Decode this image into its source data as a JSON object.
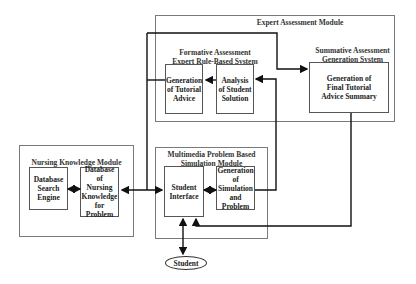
{
  "modules": {
    "expert": {
      "title": "Expert Assessment Module",
      "formative": {
        "title": "Formative Assessment\nExpert Rule-Based System",
        "tutorial_advice": "Generation\nof Tutorial\nAdvice",
        "analysis": "Analysis\nof Student\nSolution"
      },
      "summative": {
        "title": "Summative Assessment\nGeneration System",
        "summary": "Generation of\nFinal Tutorial\nAdvice Summary"
      }
    },
    "nursing": {
      "title": "Nursing Knowledge Module",
      "search_engine": "Database\nSearch\nEngine",
      "database": "Database\nof\nNursing\nKnowledge\nfor Problem"
    },
    "multimedia": {
      "title": "Multimedia Problem Based\nSimulation Module",
      "student_interface": "Student\nInterface",
      "simulation": "Generation\nof\nSimulation\nand\nProblem"
    }
  },
  "student": "Student",
  "colors": {
    "line": "#111111",
    "box_border": "#7a7a7a",
    "inner_border": "#555555"
  }
}
